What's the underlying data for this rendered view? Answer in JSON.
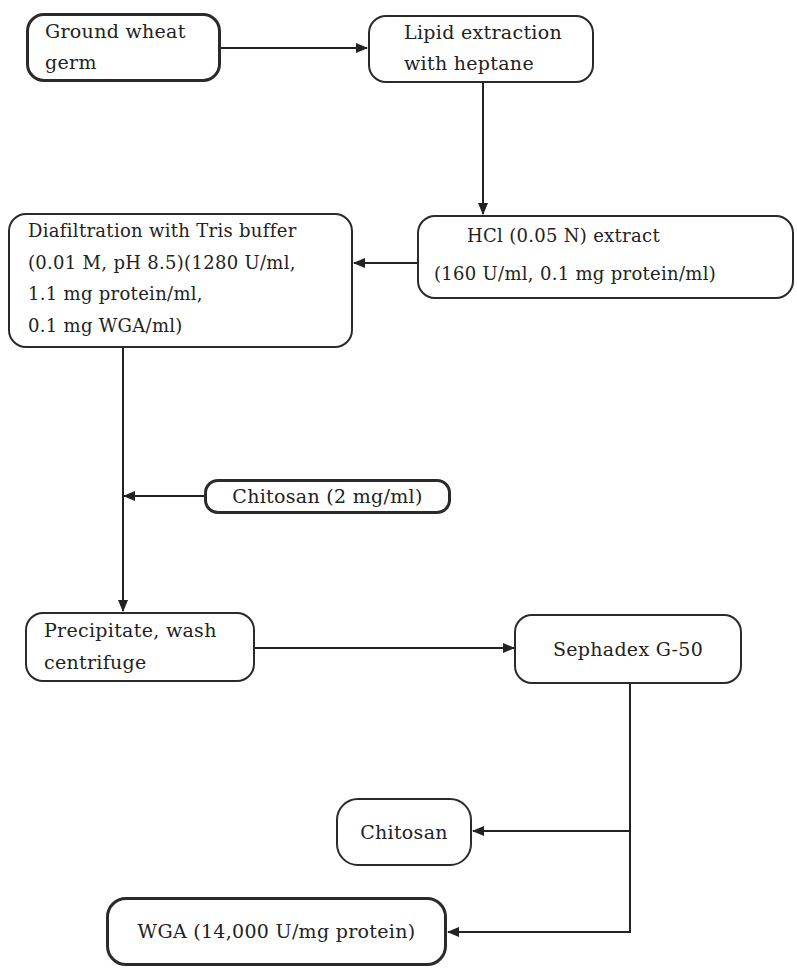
{
  "diagram": {
    "type": "flowchart",
    "nodes": [
      {
        "id": "ground_wheat_germ",
        "lines": [
          "Ground wheat",
          "germ"
        ]
      },
      {
        "id": "lipid_extraction",
        "lines": [
          "Lipid extraction",
          "with heptane"
        ]
      },
      {
        "id": "hcl_extract",
        "lines": [
          "HCl (0.05 N) extract",
          "(160 U/ml, 0.1 mg protein/ml)"
        ]
      },
      {
        "id": "diafiltration",
        "lines": [
          "Diafiltration with Tris buffer",
          "(0.01 M, pH 8.5)(1280 U/ml,",
          "1.1 mg protein/ml,",
          "0.1 mg WGA/ml)"
        ]
      },
      {
        "id": "chitosan_add",
        "lines": [
          "Chitosan (2 mg/ml)"
        ]
      },
      {
        "id": "precipitate",
        "lines": [
          "Precipitate, wash",
          "centrifuge"
        ]
      },
      {
        "id": "sephadex",
        "lines": [
          "Sephadex G-50"
        ]
      },
      {
        "id": "chitosan_out",
        "lines": [
          "Chitosan"
        ]
      },
      {
        "id": "wga",
        "lines": [
          "WGA (14,000 U/mg protein)"
        ]
      }
    ],
    "edges": [
      {
        "from": "ground_wheat_germ",
        "to": "lipid_extraction"
      },
      {
        "from": "lipid_extraction",
        "to": "hcl_extract"
      },
      {
        "from": "hcl_extract",
        "to": "diafiltration"
      },
      {
        "from": "diafiltration",
        "to": "precipitate"
      },
      {
        "from": "chitosan_add",
        "to": "diafiltration-precipitate-line"
      },
      {
        "from": "precipitate",
        "to": "sephadex"
      },
      {
        "from": "sephadex",
        "to": "chitosan_out"
      },
      {
        "from": "sephadex",
        "to": "wga"
      }
    ]
  }
}
